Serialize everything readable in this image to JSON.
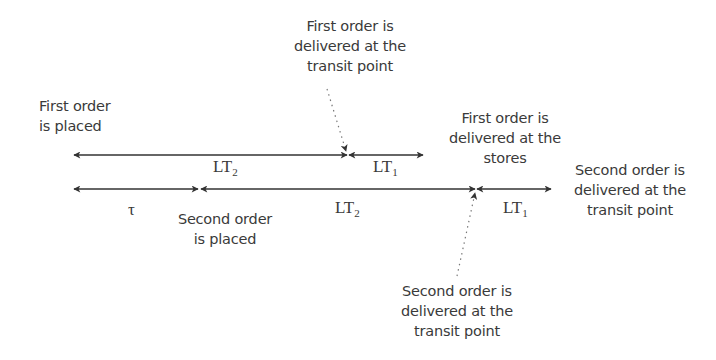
{
  "diagram": {
    "type": "timeline",
    "colors": {
      "line": "#333333",
      "text": "#3a3a3a",
      "background": "#ffffff"
    },
    "annotations": {
      "first_order_placed": "First order\nis placed",
      "first_delivered_transit": "First order is\ndelivered at the\ntransit point",
      "first_delivered_stores": "First order is\ndelivered at the\nstores",
      "second_delivered_transit_right": "Second order is\ndelivered at the\ntransit point",
      "second_order_placed": "Second order\nis placed",
      "second_delivered_transit_bottom": "Second order is\ndelivered at the\ntransit point"
    },
    "timeline_1": {
      "segments": [
        {
          "label": "LT",
          "subscript": "2"
        },
        {
          "label": "LT",
          "subscript": "1"
        }
      ]
    },
    "timeline_2": {
      "segments": [
        {
          "label": "τ",
          "subscript": ""
        },
        {
          "label": "LT",
          "subscript": "2"
        },
        {
          "label": "LT",
          "subscript": "1"
        }
      ]
    }
  }
}
